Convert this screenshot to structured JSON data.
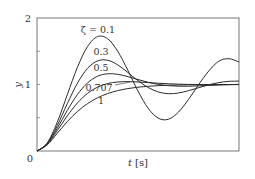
{
  "chart_data": {
    "type": "line",
    "title": "",
    "xlabel": "t [s]",
    "xlabel_italic_part": "t",
    "xlabel_unit": "[s]",
    "ylabel": "y",
    "xlim": [
      0,
      10
    ],
    "ylim": [
      0,
      2
    ],
    "yticks": [
      0,
      0.5,
      1,
      1.5,
      2
    ],
    "ytick_labels": [
      {
        "value": 0,
        "label": "0"
      },
      {
        "value": 1,
        "label": "1"
      },
      {
        "value": 2,
        "label": "2"
      }
    ],
    "xticks_labeled": false,
    "grid": false,
    "legend": "inline labels",
    "x": [
      0,
      0.5,
      1,
      1.5,
      2,
      2.5,
      3,
      3.5,
      4,
      4.5,
      5,
      5.5,
      6,
      6.5,
      7,
      7.5,
      8,
      8.5,
      9,
      9.5,
      10
    ],
    "series": [
      {
        "name": "ζ = 0.1",
        "zeta": 0.1,
        "label": "ζ = 0.1",
        "values": [
          0,
          0.1185,
          0.4302,
          0.8463,
          1.258,
          1.5707,
          1.7204,
          1.6878,
          1.498,
          1.2104,
          0.9014,
          0.6435,
          0.4944,
          0.4767,
          0.5841,
          0.7748,
          0.9972,
          1.2015,
          1.3502,
          1.3879,
          1.3385
        ]
      },
      {
        "name": "ζ = 0.3",
        "zeta": 0.3,
        "label": "0.3",
        "values": [
          0,
          0.1111,
          0.3818,
          0.7116,
          1.0186,
          1.242,
          1.3551,
          1.3647,
          1.2947,
          1.18,
          1.0571,
          0.9555,
          0.8881,
          0.8617,
          0.872,
          0.907,
          0.9518,
          0.9949,
          1.0282,
          1.0475,
          1.0512
        ]
      },
      {
        "name": "ζ = 0.5",
        "zeta": 0.5,
        "label": "0.5",
        "values": [
          0,
          0.1043,
          0.3403,
          0.6104,
          0.8494,
          1.0233,
          1.1246,
          1.1616,
          1.1533,
          1.1185,
          1.0746,
          1.0338,
          1.0023,
          0.9829,
          0.9744,
          0.9742,
          0.979,
          0.986,
          0.993,
          0.9985,
          1.0021
        ]
      },
      {
        "name": "ζ = 0.707",
        "zeta": 0.707,
        "label": "0.707",
        "values": [
          0,
          0.0986,
          0.3049,
          0.5288,
          0.7221,
          0.8661,
          0.9607,
          1.0141,
          1.038,
          1.0432,
          1.0381,
          1.0289,
          1.0193,
          1.0112,
          1.0052,
          1.0014,
          0.9992,
          0.9983,
          0.9982,
          0.9984,
          0.9988
        ]
      },
      {
        "name": "ζ = 1",
        "zeta": 1,
        "label": "1",
        "values": [
          0,
          0.0902,
          0.2642,
          0.4422,
          0.594,
          0.7127,
          0.8009,
          0.8641,
          0.9084,
          0.9389,
          0.9596,
          0.9734,
          0.9826,
          0.9887,
          0.9927,
          0.9953,
          0.997,
          0.9981,
          0.9988,
          0.9992,
          0.9995
        ]
      }
    ],
    "annotations": [
      {
        "text": "ζ = 0.1",
        "series": 0
      },
      {
        "text": "0.3",
        "series": 1
      },
      {
        "text": "0.5",
        "series": 2
      },
      {
        "text": "0.707",
        "series": 3,
        "leader_line": true
      },
      {
        "text": "1",
        "series": 4
      }
    ]
  },
  "style": {
    "line_color": "#2b2b2b",
    "axis_color": "#555555",
    "text_color": "#333333",
    "background": "#ffffff"
  }
}
